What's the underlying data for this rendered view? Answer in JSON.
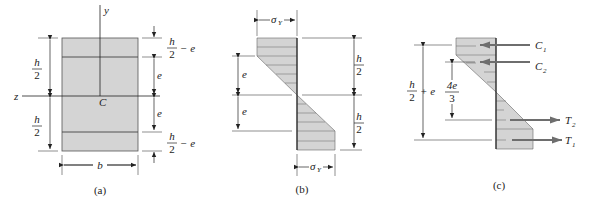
{
  "figure": {
    "panels": [
      {
        "id": "a",
        "caption": "(a)",
        "title": "Rectangular cross-section",
        "labels": {
          "y_axis": "y",
          "z_axis": "z",
          "centroid": "C",
          "width": "b",
          "half_height_num": "h",
          "half_height_den": "2",
          "elastic_core": "e",
          "plastic_zone_num": "h",
          "plastic_zone_den": "2",
          "plastic_zone_suffix": "− e"
        }
      },
      {
        "id": "b",
        "caption": "(b)",
        "title": "Elastoplastic stress distribution",
        "labels": {
          "yield_stress": "σ",
          "yield_sub": "Y",
          "core": "e",
          "half_height_num": "h",
          "half_height_den": "2"
        }
      },
      {
        "id": "c",
        "caption": "(c)",
        "title": "Resultant forces",
        "labels": {
          "C1": "C",
          "C1_sub": "1",
          "C2": "C",
          "C2_sub": "2",
          "T1": "T",
          "T1_sub": "1",
          "T2": "T",
          "T2_sub": "2",
          "arm1_num": "h",
          "arm1_den": "2",
          "arm1_suffix": "+ e",
          "arm2_num": "4e",
          "arm2_den": "3"
        }
      }
    ],
    "colors": {
      "fill": "#d4d4d4",
      "stroke": "#222222",
      "arrow": "#6e6e6e"
    }
  }
}
